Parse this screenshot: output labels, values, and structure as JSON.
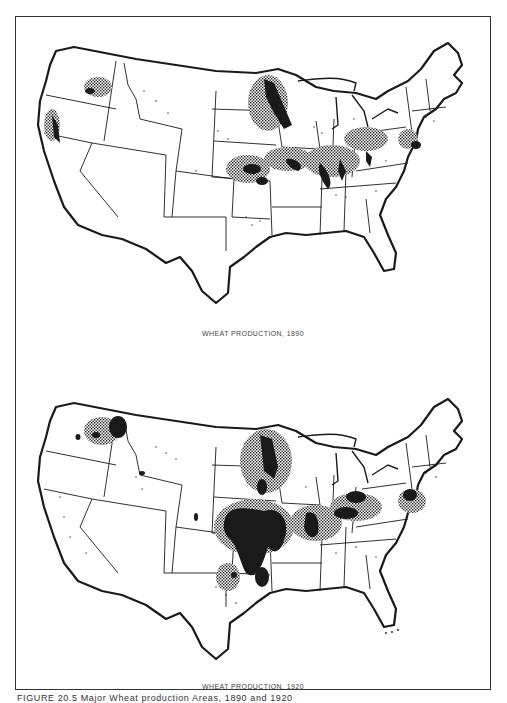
{
  "figure": {
    "caption": "FIGURE 20.5   Major Wheat production Areas, 1890 and 1920"
  },
  "maps": [
    {
      "year": "1890",
      "label": "WHEAT PRODUCTION, 1890"
    },
    {
      "year": "1920",
      "label": "WHEAT PRODUCTION, 1920"
    }
  ],
  "legend_symbols": {
    "solid_black": "major wheat production area",
    "crosshatch_stipple": "secondary wheat production area",
    "dots": "scattered wheat production"
  },
  "colors": {
    "ink": "#1a1a1a",
    "background": "#ffffff",
    "label": "#444444"
  }
}
